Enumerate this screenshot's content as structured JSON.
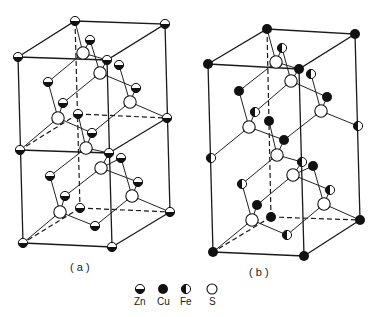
{
  "figure": {
    "panels": [
      {
        "id": "a",
        "caption": "( a )"
      },
      {
        "id": "b",
        "caption": "( b )"
      }
    ],
    "legend": [
      {
        "symbol": "half-filled-horizontal",
        "label": "Zn"
      },
      {
        "symbol": "filled",
        "label": "Cu"
      },
      {
        "symbol": "half-filled-vertical",
        "label": "Fe"
      },
      {
        "symbol": "open",
        "label": "S"
      }
    ]
  },
  "colors": {
    "ink": "#1a1a1a",
    "background": "#ffffff"
  }
}
